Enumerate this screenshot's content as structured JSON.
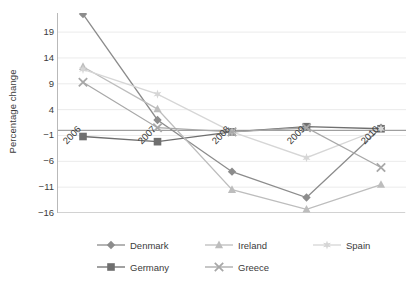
{
  "chart_data": {
    "type": "line",
    "title": "",
    "xlabel": "",
    "ylabel": "Percentage change",
    "categories": [
      "2006",
      "2007",
      "2008",
      "2009",
      "2010"
    ],
    "ylim": [
      -16,
      22.5
    ],
    "yticks": [
      19,
      14,
      9,
      4,
      -1,
      -6,
      -11,
      -16
    ],
    "ytick_labels": [
      "19",
      "14",
      "9",
      "4",
      "−1",
      "−6",
      "−11",
      "−16"
    ],
    "grid": "horizontal",
    "legend_position": "bottom",
    "series": [
      {
        "name": "Denmark",
        "marker": "diamond",
        "color": "#8c8c8c",
        "values": [
          22.5,
          2.0,
          -8.0,
          -13.0,
          0.5
        ]
      },
      {
        "name": "Germany",
        "marker": "square",
        "color": "#6f6f6f",
        "values": [
          -1.2,
          -2.2,
          -0.3,
          0.7,
          0.3
        ]
      },
      {
        "name": "Ireland",
        "marker": "triangle",
        "color": "#bdbdbd",
        "values": [
          12.3,
          4.1,
          -11.5,
          -15.3,
          -10.5
        ]
      },
      {
        "name": "Spain",
        "marker": "star",
        "color": "#d6d6d6",
        "values": [
          11.8,
          7.0,
          -0.3,
          -5.3,
          0.3
        ]
      },
      {
        "name": "Greece",
        "marker": "cross",
        "color": "#a8a8a8",
        "values": [
          9.3,
          0.5,
          -0.3,
          0.5,
          -7.2
        ]
      }
    ]
  },
  "colors": {
    "axis": "#b9b9b9",
    "gridline": "#ebebeb",
    "zero_line": "#8a8a8a",
    "text": "#3b3b3b",
    "background": "#ffffff"
  },
  "legend": {
    "items": [
      {
        "label": "Denmark",
        "marker": "diamond",
        "color": "#8c8c8c"
      },
      {
        "label": "Ireland",
        "marker": "triangle",
        "color": "#bdbdbd"
      },
      {
        "label": "Spain",
        "marker": "star",
        "color": "#d6d6d6"
      },
      {
        "label": "Germany",
        "marker": "square",
        "color": "#6f6f6f"
      },
      {
        "label": "Greece",
        "marker": "cross",
        "color": "#a8a8a8"
      }
    ]
  }
}
